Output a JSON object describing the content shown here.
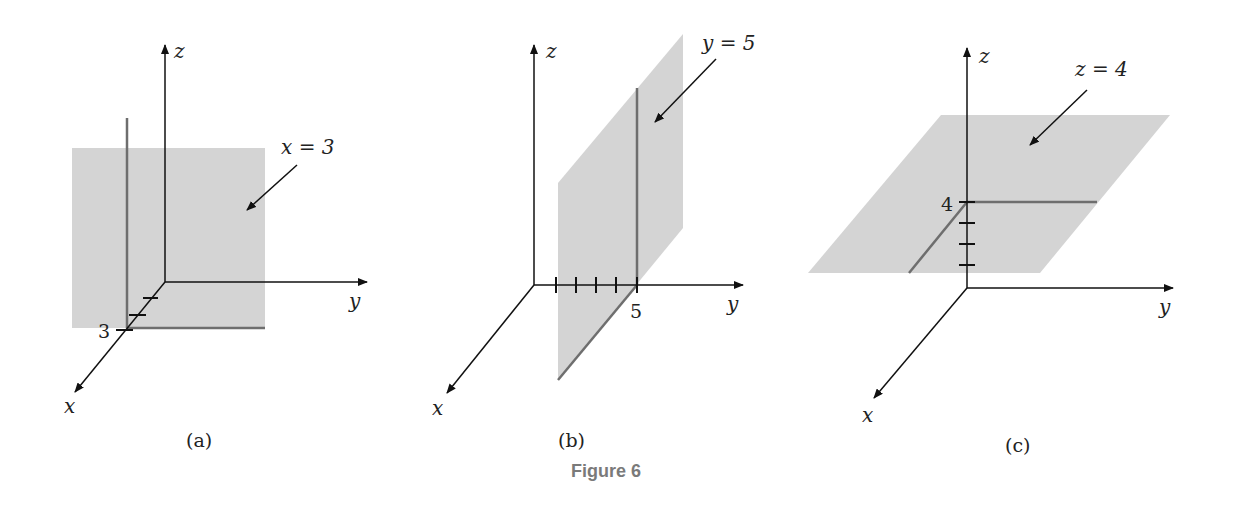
{
  "figure": {
    "caption": "Figure 6",
    "plane_color": "#d4d4d4",
    "trace_color": "#6e6e6e",
    "panels": [
      {
        "id": "a",
        "caption": "(a)",
        "equation": "x = 3",
        "axes": {
          "x": "x",
          "y": "y",
          "z": "z"
        },
        "tick_label": "3",
        "ticks": 3
      },
      {
        "id": "b",
        "caption": "(b)",
        "equation": "y = 5",
        "axes": {
          "x": "x",
          "y": "y",
          "z": "z"
        },
        "tick_label": "5",
        "ticks": 5
      },
      {
        "id": "c",
        "caption": "(c)",
        "equation": "z = 4",
        "axes": {
          "x": "x",
          "y": "y",
          "z": "z"
        },
        "tick_label": "4",
        "ticks": 4
      }
    ]
  }
}
